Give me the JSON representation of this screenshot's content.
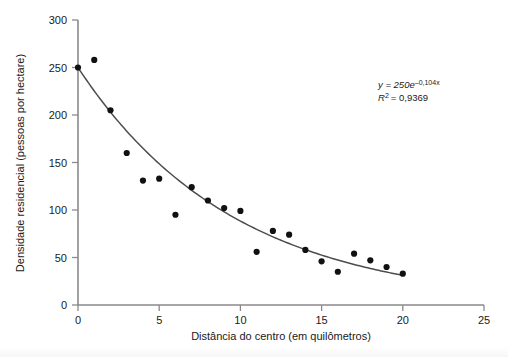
{
  "chart_data": {
    "type": "scatter",
    "title": "",
    "xlabel": "Distância do centro (em quilômetros)",
    "ylabel": "Densidade residencial (pessoas por hectare)",
    "xlim": [
      0,
      25
    ],
    "ylim": [
      0,
      300
    ],
    "xticks": [
      0,
      5,
      10,
      15,
      20,
      25
    ],
    "yticks": [
      0,
      50,
      100,
      150,
      200,
      250,
      300
    ],
    "xtick_labels": [
      "0",
      "5",
      "10",
      "15",
      "20",
      "25"
    ],
    "ytick_labels": [
      "0",
      "50",
      "100",
      "150",
      "200",
      "250",
      "300"
    ],
    "grid": false,
    "legend": false,
    "x": [
      0,
      1,
      2,
      3,
      4,
      5,
      6,
      7,
      8,
      9,
      10,
      11,
      12,
      13,
      14,
      15,
      16,
      17,
      18,
      19,
      20
    ],
    "values": [
      250,
      258,
      205,
      160,
      131,
      133,
      95,
      124,
      110,
      102,
      99,
      56,
      78,
      74,
      58,
      46,
      35,
      54,
      47,
      40,
      33
    ],
    "series": [
      {
        "name": "Densidade residencial observada",
        "marker": "circle",
        "color": "#111111",
        "points": [
          {
            "x": 0,
            "y": 250
          },
          {
            "x": 1,
            "y": 258
          },
          {
            "x": 2,
            "y": 205
          },
          {
            "x": 3,
            "y": 160
          },
          {
            "x": 4,
            "y": 131
          },
          {
            "x": 5,
            "y": 133
          },
          {
            "x": 6,
            "y": 95
          },
          {
            "x": 7,
            "y": 124
          },
          {
            "x": 8,
            "y": 110
          },
          {
            "x": 9,
            "y": 102
          },
          {
            "x": 10,
            "y": 99
          },
          {
            "x": 11,
            "y": 56
          },
          {
            "x": 12,
            "y": 78
          },
          {
            "x": 13,
            "y": 74
          },
          {
            "x": 14,
            "y": 58
          },
          {
            "x": 15,
            "y": 46
          },
          {
            "x": 16,
            "y": 35
          },
          {
            "x": 17,
            "y": 54
          },
          {
            "x": 18,
            "y": 47
          },
          {
            "x": 19,
            "y": 40
          },
          {
            "x": 20,
            "y": 33
          }
        ]
      },
      {
        "name": "Curva de ajuste exponencial",
        "type": "line",
        "color": "#4d4d4d",
        "model": "exponential",
        "coefficient": 250,
        "rate": -0.104,
        "x_range": [
          0,
          20
        ]
      }
    ],
    "annotations": {
      "equation_y": "y = 250",
      "equation_base": "e",
      "equation_exponent": "–0,104x",
      "r_squared_label": "R",
      "r_squared_sup": "2",
      "r_squared_value": "= 0,9369",
      "equation_full": "y = 250e−0,104x",
      "r_squared_full": "R² = 0,9369"
    },
    "colors": {
      "marker": "#111111",
      "curve": "#4d4d4d",
      "axis": "#8a8a8a",
      "text": "#1a1a1a",
      "background": "#ffffff"
    }
  }
}
